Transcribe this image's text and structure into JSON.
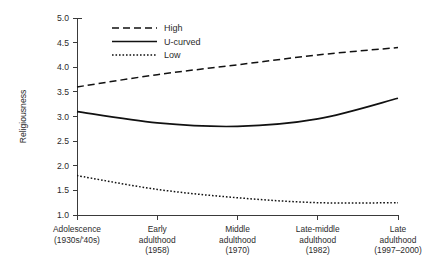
{
  "chart_data": {
    "type": "line",
    "title": "",
    "xlabel": "",
    "ylabel": "Religiousness",
    "ylim": [
      1.0,
      5.0
    ],
    "ytick_step": 0.5,
    "grid": false,
    "legend_position": "top-left-inside",
    "categories": [
      "Adolescence\n(1930s/'40s)",
      "Early\nadulthood\n(1958)",
      "Middle\nadulthood\n(1970)",
      "Late-middle\nadulthood\n(1982)",
      "Late\nadulthood\n(1997–2000)"
    ],
    "category_lines": [
      [
        "Adolescence",
        "(1930s/'40s)"
      ],
      [
        "Early",
        "adulthood",
        "(1958)"
      ],
      [
        "Middle",
        "adulthood",
        "(1970)"
      ],
      [
        "Late-middle",
        "adulthood",
        "(1982)"
      ],
      [
        "Late",
        "adulthood",
        "(1997–2000)"
      ]
    ],
    "ytick_labels": [
      "1.0",
      "1.5",
      "2.0",
      "2.5",
      "3.0",
      "3.5",
      "4.0",
      "4.5",
      "5.0"
    ],
    "ytick_values": [
      1.0,
      1.5,
      2.0,
      2.5,
      3.0,
      3.5,
      4.0,
      4.5,
      5.0
    ],
    "series": [
      {
        "name": "High",
        "style": "dashed",
        "color": "#111111",
        "values": [
          3.6,
          3.85,
          4.05,
          4.25,
          4.4
        ]
      },
      {
        "name": "U-curved",
        "style": "solid",
        "color": "#111111",
        "values": [
          3.1,
          2.87,
          2.8,
          2.95,
          3.37
        ]
      },
      {
        "name": "Low",
        "style": "dotted",
        "color": "#111111",
        "values": [
          1.8,
          1.52,
          1.35,
          1.25,
          1.25
        ]
      }
    ]
  },
  "legend": {
    "entries": [
      {
        "label": "High"
      },
      {
        "label": "U-curved"
      },
      {
        "label": "Low"
      }
    ]
  },
  "axis": {
    "y_title": "Religiousness"
  }
}
